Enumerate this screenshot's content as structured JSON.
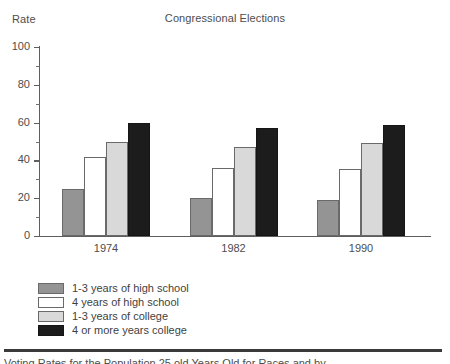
{
  "chart_data": {
    "type": "bar",
    "title": "Congressional Elections",
    "xlabel": "Year of Election",
    "ylabel": "Rate",
    "categories": [
      "1974",
      "1982",
      "1990"
    ],
    "series": [
      {
        "name": "1-3 years of high school",
        "color": "#949494",
        "values": [
          25,
          20,
          19
        ]
      },
      {
        "name": "4 years of high school",
        "color": "#ffffff",
        "values": [
          42,
          36,
          35.5
        ]
      },
      {
        "name": "1-3 years of college",
        "color": "#d9d9d9",
        "values": [
          50,
          47,
          49
        ]
      },
      {
        "name": "4 or more years college",
        "color": "#1c1c1c",
        "values": [
          60,
          57,
          58.5
        ]
      }
    ],
    "ylim": [
      0,
      100
    ],
    "yticks": [
      0,
      20,
      40,
      60,
      80,
      100
    ],
    "ytick_labels": [
      "0",
      "20",
      "40",
      "60",
      "80",
      "100"
    ],
    "yminor_ticks": [
      10,
      30,
      50,
      70,
      90
    ],
    "grid": false,
    "legend_position": "below-axes-left"
  },
  "footer": {
    "caption": "Voting Rates for the Population 25 old Years Old for Races and by"
  }
}
